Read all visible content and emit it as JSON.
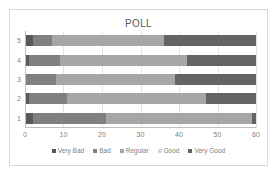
{
  "chart_data": {
    "type": "bar",
    "orientation": "horizontal",
    "stacked": true,
    "title": "POLL",
    "xlabel": "",
    "ylabel": "",
    "categories": [
      "1",
      "2",
      "3",
      "4",
      "5"
    ],
    "category_order_top_to_bottom": [
      "5",
      "4",
      "3",
      "2",
      "1"
    ],
    "xlim": [
      0,
      60
    ],
    "xticks": [
      0,
      10,
      20,
      30,
      40,
      50,
      60
    ],
    "xtick_labels": [
      "0",
      "10",
      "20",
      "30",
      "40",
      "50",
      "60"
    ],
    "grid": true,
    "legend_position": "bottom",
    "series": [
      {
        "name": "Very Bad",
        "color": "#595959",
        "values": [
          2,
          1,
          0,
          1,
          2
        ]
      },
      {
        "name": "Bad",
        "color": "#808080",
        "values": [
          19,
          10,
          8,
          8,
          5
        ]
      },
      {
        "name": "Regular",
        "color": "#a6a6a6",
        "values": [
          38,
          36,
          31,
          33,
          29
        ]
      },
      {
        "name": "Good",
        "color": "#d9d9d9",
        "values": [
          0,
          0,
          0,
          0,
          0
        ]
      },
      {
        "name": "Very Good",
        "color": "#646464",
        "values": [
          1,
          13,
          21,
          18,
          24
        ]
      }
    ],
    "legend_entries": [
      "Very Bad",
      "Bad",
      "Regular",
      "Good",
      "Very Good"
    ],
    "colors": {
      "very_bad": "#595959",
      "bad": "#808080",
      "regular": "#a6a6a6",
      "good": "#d9d9d9",
      "very_good": "#646464",
      "grid": "#e3e3e3",
      "axis": "#bfbfbf",
      "text": "#808080",
      "title_text": "#595959",
      "plot_background": "#ffffff",
      "frame_border": "#d9d9d9"
    }
  }
}
